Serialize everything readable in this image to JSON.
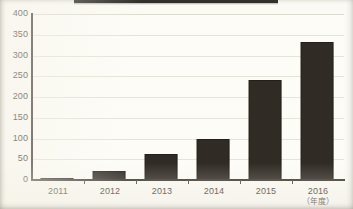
{
  "figure": {
    "banner_remnant": "cropped-title-banner",
    "background_color": "#fbfaf4",
    "bar_color": "#302b25",
    "axis_color": "#3a342c",
    "gridline_color": "#e6e3d9"
  },
  "chart_data": {
    "type": "bar",
    "title": "",
    "subtitle": "",
    "xlabel": "",
    "xlabel_note": "（年度）",
    "ylabel": "",
    "categories": [
      "2011",
      "2012",
      "2013",
      "2014",
      "2015",
      "2016"
    ],
    "values": [
      3,
      22,
      62,
      100,
      242,
      332
    ],
    "ylim": [
      0,
      400
    ],
    "ytick_labels": [
      "0",
      "50",
      "100",
      "150",
      "200",
      "250",
      "300",
      "350",
      "400"
    ],
    "ytick_values": [
      0,
      50,
      100,
      150,
      200,
      250,
      300,
      350,
      400
    ],
    "grid": "horizontal",
    "legend": "none",
    "series": [
      {
        "name": "",
        "values": [
          3,
          22,
          62,
          100,
          242,
          332
        ]
      }
    ]
  }
}
